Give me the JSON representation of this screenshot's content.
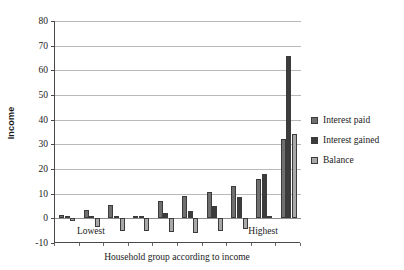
{
  "chart_data": {
    "type": "bar",
    "title": "",
    "xlabel": "Household group according to income",
    "ylabel": "Income",
    "ylim": [
      -10,
      80
    ],
    "ytick_step": 10,
    "yticks": [
      80,
      70,
      60,
      50,
      40,
      30,
      20,
      10,
      0,
      -10
    ],
    "grid": true,
    "legend_position": "right",
    "categories": [
      "1",
      "2",
      "3",
      "4",
      "5",
      "6",
      "7",
      "8",
      "9",
      "10"
    ],
    "category_annotations": [
      {
        "index": 1,
        "label": "Lowest"
      },
      {
        "index": 8,
        "label": "Highest"
      }
    ],
    "series": [
      {
        "name": "Interest paid",
        "color": "#6f6f6f",
        "values": [
          1.5,
          3.5,
          5.5,
          1.0,
          7.0,
          9.0,
          10.5,
          13.0,
          16.0,
          32.0
        ]
      },
      {
        "name": "Interest gained",
        "color": "#3c3c3c",
        "values": [
          0.3,
          0.5,
          0.5,
          0.2,
          2.0,
          2.8,
          5.2,
          8.5,
          18.0,
          66.0
        ]
      },
      {
        "name": "Balance",
        "color": "#a8a8a8",
        "values": [
          -1.2,
          -3.5,
          -5.0,
          -5.0,
          -5.5,
          -6.0,
          -5.2,
          -4.5,
          1.0,
          34.0
        ]
      }
    ]
  },
  "legend": {
    "items": [
      {
        "label": "Interest paid",
        "color": "#6f6f6f"
      },
      {
        "label": "Interest gained",
        "color": "#3c3c3c"
      },
      {
        "label": "Balance",
        "color": "#a8a8a8"
      }
    ]
  }
}
